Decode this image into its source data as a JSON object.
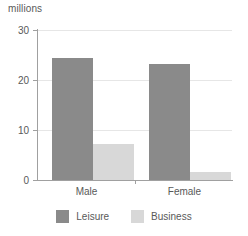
{
  "chart_data": {
    "type": "bar",
    "title": "",
    "subtitle": "",
    "xlabel": "",
    "ylabel": "millions",
    "categories": [
      "Male",
      "Female"
    ],
    "series": [
      {
        "name": "Leisure",
        "values": [
          24.5,
          23.3
        ],
        "color": "#8a8a8a"
      },
      {
        "name": "Business",
        "values": [
          7.3,
          1.6
        ]
      }
    ],
    "ylim": [
      0,
      30
    ],
    "yticks": [
      0,
      10,
      20,
      30
    ],
    "ytick_labels": [
      "0",
      "10",
      "20",
      "30"
    ],
    "grid": true,
    "legend_position": "bottom",
    "colors": {
      "leisure": "#8a8a8a",
      "business": "#d8d8d8",
      "axis": "#a0a0a0",
      "grid": "#e6e6e6",
      "text": "#595959",
      "background": "#ffffff"
    }
  },
  "axis": {
    "unit_label": "millions",
    "ytick_0": "0",
    "ytick_1": "10",
    "ytick_2": "20",
    "ytick_3": "30"
  },
  "categories": {
    "male": "Male",
    "female": "Female"
  },
  "legend": {
    "leisure_label": "Leisure",
    "business_label": "Business"
  }
}
